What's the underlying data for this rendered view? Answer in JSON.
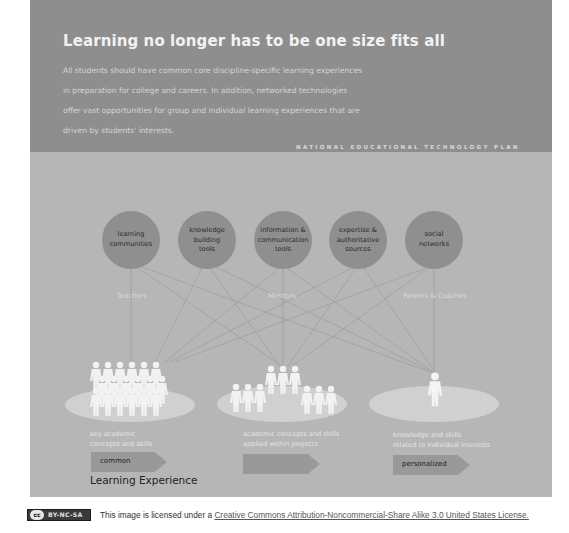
{
  "header": {
    "title": "Learning no longer has to be one size fits all",
    "body_lines": [
      "All students should have common core discipline-specific learning experiences",
      "in preparation for college and careers. In addition, networked technologies",
      "offer vast opportunities for group and individual learning experiences that are",
      "driven by students' interests."
    ],
    "plan_label": "NATIONAL EDUCATIONAL TECHNOLOGY PLAN"
  },
  "resources": [
    {
      "lines": [
        "learning",
        "communities"
      ]
    },
    {
      "lines": [
        "knowledge",
        "building",
        "tools"
      ]
    },
    {
      "lines": [
        "information &",
        "communication",
        "tools"
      ]
    },
    {
      "lines": [
        "expertise &",
        "authoritative",
        "sources"
      ]
    },
    {
      "lines": [
        "social",
        "networks"
      ]
    }
  ],
  "roles": [
    "Teachers",
    "Mentors",
    "Parents & Coaches"
  ],
  "groups": [
    {
      "desc_lines": [
        "key academic",
        "concepts and skills"
      ],
      "arrow_label": "common"
    },
    {
      "desc_lines": [
        "academic concepts and skills",
        "applied within projects"
      ],
      "arrow_label": ""
    },
    {
      "desc_lines": [
        "knowledge and skills",
        "related to individual interests"
      ],
      "arrow_label": "personalized"
    }
  ],
  "footer_label": "Learning Experience",
  "license": {
    "badge_cc": "cc",
    "badge_text": "BY-NC-SA",
    "prefix": "This image is licensed under a ",
    "link_text": "Creative Commons Attribution-Noncommercial-Share Alike 3.0 United States License."
  },
  "colors": {
    "header_bg": "#8e8e8e",
    "panel_bg": "#b6b6b6",
    "circle_fill": "#8f8f8f",
    "ellipse_fill": "#d0d0d0",
    "arrow_fill": "#999999",
    "people": "#f4f4f4"
  }
}
